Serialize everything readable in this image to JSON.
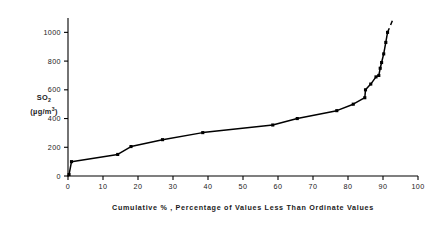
{
  "chart_data": {
    "type": "line",
    "title": "",
    "xlabel": "Cumulative % , Percentage of Values Less Than Ordinate Values",
    "ylabel_line1": "SO",
    "ylabel_sub": "2",
    "ylabel_line2": "(µg/m",
    "ylabel_sup": "3",
    "ylabel_close": ")",
    "ylabel_full": "SO2 (µg/m3)",
    "xlim": [
      0,
      100
    ],
    "ylim": [
      0,
      1100
    ],
    "xticks": [
      0,
      10,
      20,
      30,
      40,
      50,
      60,
      70,
      80,
      90,
      100
    ],
    "xtick_labels": [
      "0",
      "10",
      "20",
      "30",
      "40",
      "50",
      "60",
      "70",
      "80",
      "90",
      "100"
    ],
    "yticks": [
      0,
      200,
      400,
      600,
      800,
      1000
    ],
    "ytick_labels": [
      "0",
      "200",
      "400",
      "600",
      "800",
      "1000"
    ],
    "grid": false,
    "legend": "none",
    "marker": "filled-square",
    "line_color": "#000000",
    "marker_color": "#000000",
    "x": [
      0.3,
      1.0,
      14.2,
      18.0,
      27.0,
      38.5,
      58.5,
      65.5,
      76.8,
      81.5,
      84.8,
      85.0,
      86.5,
      88.0,
      88.8,
      89.2,
      89.6,
      90.2,
      90.8,
      91.3
    ],
    "values": [
      10,
      100,
      150,
      205,
      253,
      302,
      355,
      400,
      455,
      500,
      545,
      600,
      640,
      690,
      700,
      750,
      790,
      850,
      930,
      1000
    ],
    "annotations": [
      {
        "type": "dashed-extension",
        "from_x": 91.3,
        "from_y": 1000,
        "to_x": 93.0,
        "to_y": 1100,
        "label": "extrapolated tail"
      }
    ]
  },
  "figure": {
    "background": "#ffffff",
    "axis_color": "#000000"
  }
}
